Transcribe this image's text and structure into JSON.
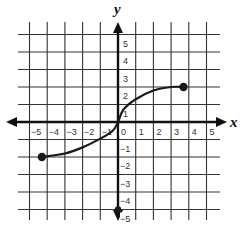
{
  "chart_data": {
    "type": "line",
    "title": "",
    "xlabel": "x",
    "ylabel": "y",
    "xlim": [
      -5,
      5
    ],
    "ylim": [
      -5,
      5
    ],
    "grid": true,
    "x_ticks": [
      -5,
      -4,
      -3,
      -2,
      -1,
      0,
      1,
      2,
      3,
      4,
      5
    ],
    "y_ticks": [
      -5,
      -4,
      -3,
      -2,
      -1,
      1,
      2,
      3,
      4,
      5
    ],
    "x_tick_labels": [
      "−5",
      "−4",
      "−3",
      "−2",
      "−1",
      "0",
      "1",
      "2",
      "3",
      "4",
      "5"
    ],
    "y_tick_labels": [
      "−5",
      "−4",
      "−3",
      "−2",
      "−1",
      "1",
      "2",
      "3",
      "4",
      "5"
    ],
    "series": [
      {
        "name": "curve",
        "description": "S-shaped (cube-root-like) curve through origin with closed endpoints",
        "points": [
          {
            "x": -4.3,
            "y": -2.0
          },
          {
            "x": -3,
            "y": -1.8
          },
          {
            "x": -2,
            "y": -1.45
          },
          {
            "x": -1,
            "y": -0.95
          },
          {
            "x": -0.3,
            "y": -0.5
          },
          {
            "x": 0,
            "y": 0
          },
          {
            "x": 0.3,
            "y": 0.7
          },
          {
            "x": 1,
            "y": 1.3
          },
          {
            "x": 2,
            "y": 1.8
          },
          {
            "x": 3,
            "y": 2.0
          },
          {
            "x": 3.7,
            "y": 2.0
          }
        ],
        "endpoints": [
          {
            "x": -4.3,
            "y": -2,
            "style": "closed"
          },
          {
            "x": 3.7,
            "y": 2,
            "style": "closed"
          }
        ]
      }
    ],
    "annotations": [
      {
        "type": "point",
        "x": 0,
        "y": -5,
        "style": "closed"
      }
    ],
    "colors": {
      "grid": "#333333",
      "axis": "#111111",
      "curve": "#1a1a1a"
    }
  }
}
